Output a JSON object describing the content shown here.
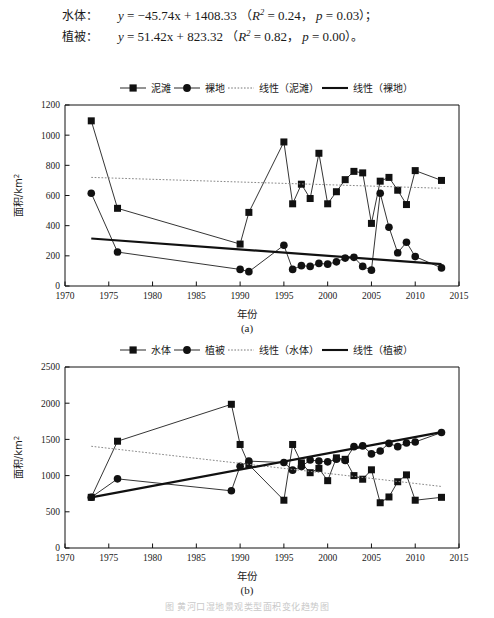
{
  "equations": {
    "water": {
      "label": "水体：",
      "lhs": "y",
      "rhs": "= −45.74x + 1408.33",
      "stats_open": "（",
      "r2_sym": "R",
      "r2_sup": "2",
      "r2_val": "= 0.24",
      "sep": "，",
      "p_sym": "p",
      "p_val": "= 0.03",
      "stats_close": "）；"
    },
    "vegetation": {
      "label": "植被：",
      "lhs": "y",
      "rhs": "= 51.42x + 823.32",
      "stats_open": "（",
      "r2_sym": "R",
      "r2_sup": "2",
      "r2_val": "= 0.82",
      "sep": "，",
      "p_sym": "p",
      "p_val": "= 0.00",
      "stats_close": "）。"
    }
  },
  "figure_caption": "图  黄河口湿地景观类型面积变化趋势图",
  "chart_data": [
    {
      "id": "a",
      "type": "line",
      "panel_label": "(a)",
      "title": "",
      "xlabel": "年份",
      "ylabel": "面积/km",
      "ylabel_sup": "2",
      "xlim": [
        1970,
        2015
      ],
      "ylim": [
        0,
        1200
      ],
      "xticks": [
        1970,
        1975,
        1980,
        1985,
        1990,
        1995,
        2000,
        2005,
        2010,
        2015
      ],
      "yticks": [
        0,
        200,
        400,
        600,
        800,
        1000,
        1200
      ],
      "grid": false,
      "legend_position": "top",
      "legend": [
        {
          "name": "泥滩",
          "marker": "square",
          "style": "solid"
        },
        {
          "name": "裸地",
          "marker": "circle",
          "style": "solid"
        },
        {
          "name": "线性（泥滩）",
          "marker": "none",
          "style": "dotted"
        },
        {
          "name": "线性（裸地）",
          "marker": "none",
          "style": "thick"
        }
      ],
      "series": [
        {
          "name": "泥滩",
          "marker": "square",
          "x": [
            1973,
            1976,
            1990,
            1991,
            1995,
            1996,
            1997,
            1998,
            1999,
            2000,
            2001,
            2002,
            2003,
            2004,
            2005,
            2006,
            2007,
            2008,
            2009,
            2010,
            2013
          ],
          "values": [
            1095,
            515,
            278,
            488,
            955,
            545,
            675,
            580,
            880,
            545,
            625,
            705,
            760,
            750,
            415,
            695,
            720,
            635,
            540,
            765,
            700
          ]
        },
        {
          "name": "裸地",
          "marker": "circle",
          "x": [
            1973,
            1976,
            1990,
            1991,
            1995,
            1996,
            1997,
            1998,
            1999,
            2000,
            2001,
            2002,
            2003,
            2004,
            2005,
            2006,
            2007,
            2008,
            2009,
            2010,
            2013
          ],
          "values": [
            615,
            225,
            110,
            95,
            270,
            110,
            135,
            130,
            150,
            145,
            160,
            185,
            190,
            130,
            105,
            615,
            390,
            220,
            290,
            195,
            120
          ]
        }
      ],
      "trendlines": [
        {
          "name": "线性（泥滩）",
          "style": "dotted",
          "slope": -1.82,
          "x0": 1973,
          "y0": 720,
          "x1": 2013,
          "y1": 648
        },
        {
          "name": "线性（裸地）",
          "style": "thick",
          "slope": -4.25,
          "x0": 1973,
          "y0": 315,
          "x1": 2013,
          "y1": 145
        }
      ]
    },
    {
      "id": "b",
      "type": "line",
      "panel_label": "(b)",
      "title": "",
      "xlabel": "年份",
      "ylabel": "面积/km",
      "ylabel_sup": "2",
      "xlim": [
        1970,
        2015
      ],
      "ylim": [
        0,
        2500
      ],
      "xticks": [
        1970,
        1975,
        1980,
        1985,
        1990,
        1995,
        2000,
        2005,
        2010,
        2015
      ],
      "yticks": [
        0,
        500,
        1000,
        1500,
        2000,
        2500
      ],
      "grid": false,
      "legend_position": "top",
      "legend": [
        {
          "name": "水体",
          "marker": "square",
          "style": "solid"
        },
        {
          "name": "植被",
          "marker": "circle",
          "style": "solid"
        },
        {
          "name": "线性（水体）",
          "marker": "none",
          "style": "dotted"
        },
        {
          "name": "线性（植被）",
          "marker": "none",
          "style": "thick"
        }
      ],
      "series": [
        {
          "name": "水体",
          "marker": "square",
          "x": [
            1973,
            1976,
            1989,
            1990,
            1991,
            1995,
            1996,
            1997,
            1998,
            1999,
            2000,
            2001,
            2002,
            2003,
            2004,
            2005,
            2006,
            2007,
            2008,
            2009,
            2010,
            2013
          ],
          "values": [
            700,
            1475,
            1985,
            1430,
            1150,
            660,
            1430,
            1175,
            1040,
            1100,
            930,
            1245,
            1225,
            1000,
            950,
            1080,
            625,
            705,
            915,
            1010,
            660,
            700
          ]
        },
        {
          "name": "植被",
          "marker": "circle",
          "x": [
            1973,
            1976,
            1989,
            1990,
            1991,
            1995,
            1996,
            1997,
            1998,
            1999,
            2000,
            2001,
            2002,
            2003,
            2004,
            2005,
            2006,
            2007,
            2008,
            2009,
            2010,
            2013
          ],
          "values": [
            700,
            955,
            790,
            1130,
            1200,
            1180,
            1075,
            1125,
            1215,
            1200,
            1190,
            1225,
            1210,
            1400,
            1410,
            1300,
            1340,
            1445,
            1400,
            1450,
            1465,
            1595
          ]
        }
      ],
      "trendlines": [
        {
          "name": "线性（水体）",
          "style": "dotted",
          "slope": -11.4,
          "x0": 1973,
          "y0": 1405,
          "x1": 2013,
          "y1": 850
        },
        {
          "name": "线性（植被）",
          "style": "thick",
          "slope": 21.8,
          "x0": 1973,
          "y0": 700,
          "x1": 2013,
          "y1": 1600
        }
      ]
    }
  ]
}
